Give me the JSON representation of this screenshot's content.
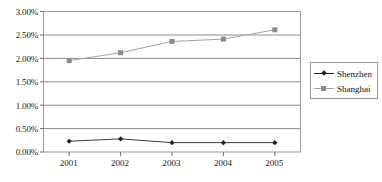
{
  "chart_data": {
    "type": "line",
    "title": "",
    "xlabel": "",
    "ylabel": "",
    "categories": [
      "2001",
      "2002",
      "2003",
      "2004",
      "2005"
    ],
    "ylim": [
      0,
      3
    ],
    "ytick_labels": [
      "3.00%",
      "2.50%",
      "2.00%",
      "1.50%",
      "1.00%",
      "0.50%",
      "0.00%"
    ],
    "ytick_values": [
      3.0,
      2.5,
      2.0,
      1.5,
      1.0,
      0.5,
      0.0
    ],
    "ytick_format": "percent",
    "grid": "horizontal",
    "legend_position": "right",
    "series": [
      {
        "name": "Shenzhen",
        "marker": "diamond",
        "color": "#222222",
        "values": [
          0.23,
          0.28,
          0.2,
          0.2,
          0.2
        ],
        "value_labels": [
          "0.23%",
          "0.28%",
          "0.20%",
          "0.20%",
          "0.20%"
        ]
      },
      {
        "name": "Shanghai",
        "marker": "square",
        "color": "#8b8b8b",
        "values": [
          1.95,
          2.12,
          2.36,
          2.41,
          2.61
        ],
        "value_labels": [
          "1.95%",
          "2.12%",
          "2.36%",
          "2.41%",
          "2.61%"
        ]
      }
    ]
  },
  "legend": {
    "items": [
      {
        "label": "Shenzhen",
        "marker": "diamond",
        "color": "#222222"
      },
      {
        "label": "Shanghai",
        "marker": "square",
        "color": "#8b8b8b"
      }
    ]
  },
  "colors": {
    "shenzhen": "#222222",
    "shanghai": "#8b8b8b",
    "grid": "#8c8c8c",
    "border": "#9a9a9a",
    "text": "#1a1a1a",
    "background": "#ffffff"
  }
}
